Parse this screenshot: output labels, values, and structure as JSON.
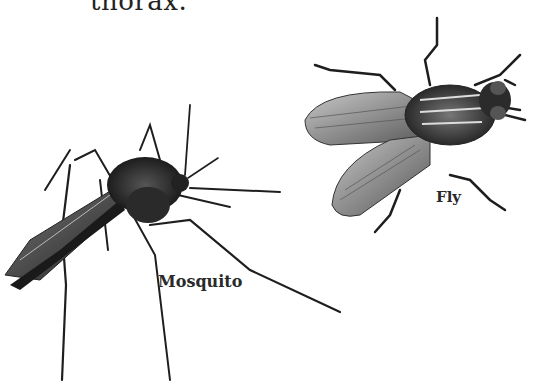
{
  "page": {
    "partial_text": "thorax."
  },
  "figure": {
    "items": [
      {
        "label": "Mosquito",
        "icon": "mosquito-illustration"
      },
      {
        "label": "Fly",
        "icon": "fly-illustration"
      }
    ]
  },
  "colors": {
    "ink": "#1e1e1e",
    "wing": "#8a8a8a",
    "background": "#ffffff"
  }
}
